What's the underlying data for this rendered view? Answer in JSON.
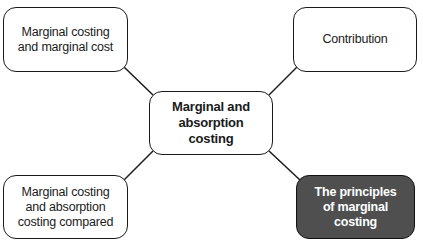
{
  "diagram": {
    "type": "mind-map",
    "center": {
      "label": "Marginal and absorption costing"
    },
    "nodes": [
      {
        "id": "top-left",
        "label": "Marginal costing and marginal cost",
        "highlighted": false
      },
      {
        "id": "top-right",
        "label": "Contribution",
        "highlighted": false
      },
      {
        "id": "bottom-left",
        "label": "Marginal costing and absorption costing compared",
        "highlighted": false
      },
      {
        "id": "bottom-right",
        "label": "The principles of marginal costing",
        "highlighted": true
      }
    ],
    "colors": {
      "border": "#1a1a1a",
      "node_fill": "#ffffff",
      "highlight_fill": "#4f4f4f",
      "highlight_text": "#ffffff"
    }
  }
}
